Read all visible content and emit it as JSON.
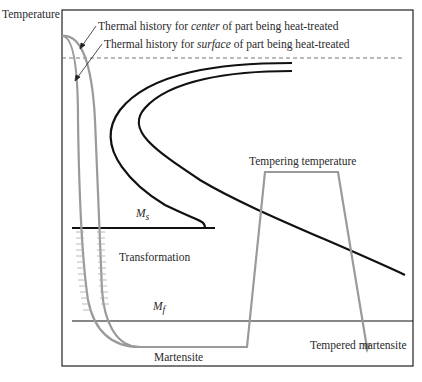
{
  "diagram": {
    "type": "TTT diagram - tempering of martensite",
    "y_axis_label": "Temperature",
    "annotations": {
      "center_history": {
        "prefix": "Thermal history for ",
        "emph": "center",
        "suffix": " of part being heat-treated"
      },
      "surface_history": {
        "prefix": "Thermal history for ",
        "emph": "surface",
        "suffix": " of part being heat-treated"
      },
      "ms": "M",
      "ms_sub": "s",
      "mf": "M",
      "mf_sub": "f",
      "transformation": "Transformation",
      "martensite": "Martensite",
      "tempering_temperature": "Tempering temperature",
      "tempered_martensite": "Tempered martensite"
    },
    "colors": {
      "frame": "#222222",
      "transformation_curves": "#111111",
      "thermal_history": "#9a9a9a",
      "dashed_eutectoid": "#777777"
    }
  }
}
